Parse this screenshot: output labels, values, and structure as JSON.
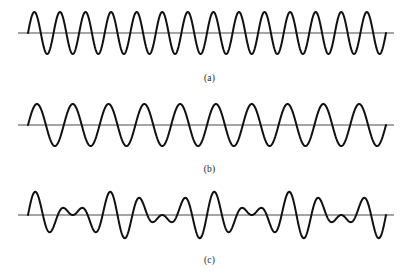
{
  "figure": {
    "background_color": "#ffffff",
    "wave_color": "#111111",
    "axis_color": "#4d4d4d",
    "width": 419,
    "height": 276
  },
  "panels": [
    {
      "id": "a",
      "caption": "(a)",
      "description": "high-frequency sinusoid",
      "axis_x_start": 18,
      "axis_x_end": 394,
      "wave_x_start": 28,
      "wave_x_end": 386,
      "baseline_y": 33,
      "amplitude": 21,
      "cycles": 14,
      "phase": 0
    },
    {
      "id": "b",
      "caption": "(b)",
      "description": "lower-frequency sinusoid",
      "axis_x_start": 18,
      "axis_x_end": 394,
      "wave_x_start": 28,
      "wave_x_end": 386,
      "baseline_y": 33,
      "amplitude": 21,
      "cycles": 10,
      "phase": 0
    },
    {
      "id": "c",
      "caption": "(c)",
      "description": "sum of the two waves showing beats",
      "axis_x_start": 18,
      "axis_x_end": 394,
      "wave_x_start": 28,
      "wave_x_end": 386,
      "baseline_y": 33,
      "amplitude": 12,
      "cycles": 14,
      "cycles_2": 10,
      "beats": 4,
      "phase": 0
    }
  ],
  "chart_data": {
    "type": "line",
    "xlabel": "",
    "ylabel": "",
    "grid": false,
    "legend": "none",
    "x_range": [
      0,
      1
    ],
    "y_range": [
      -2,
      2
    ],
    "series": [
      {
        "name": "(a)",
        "panel": "a",
        "waveform": "sine",
        "frequency_cycles": 14,
        "amplitude": 1,
        "phase": 0,
        "ylim": [
          -1,
          1
        ]
      },
      {
        "name": "(b)",
        "panel": "b",
        "waveform": "sine",
        "frequency_cycles": 10,
        "amplitude": 1,
        "phase": 0,
        "ylim": [
          -1,
          1
        ]
      },
      {
        "name": "(c)",
        "panel": "c",
        "waveform": "sum",
        "components": [
          {
            "frequency_cycles": 14,
            "amplitude": 1,
            "phase": 0
          },
          {
            "frequency_cycles": 10,
            "amplitude": 1,
            "phase": 0
          }
        ],
        "beat_count": 4,
        "amplitude": 2,
        "ylim": [
          -2,
          2
        ]
      }
    ],
    "annotations": [
      {
        "text": "(a)",
        "panel": "a"
      },
      {
        "text": "(b)",
        "panel": "b"
      },
      {
        "text": "(c)",
        "panel": "c"
      }
    ]
  }
}
